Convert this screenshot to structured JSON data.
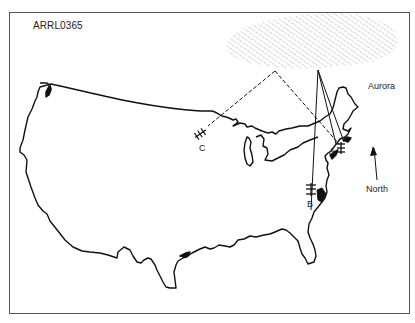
{
  "figure": {
    "id_label": "ARRL0365",
    "frame_color": "#555555",
    "line_color": "#111111",
    "hatch_color": "#9a9a9a"
  },
  "region": {
    "label": "Aurora",
    "icon": "hatched-aurora-region"
  },
  "compass": {
    "label": "North",
    "icon": "arrow-up-icon"
  },
  "stations": [
    {
      "id": "A",
      "label": "A",
      "icon": "antenna-icon"
    },
    {
      "id": "B",
      "label": "B",
      "icon": "antenna-icon"
    },
    {
      "id": "C",
      "label": "C",
      "icon": "antenna-icon"
    }
  ],
  "paths": [
    {
      "from": "A",
      "to": "B",
      "via": "Aurora",
      "style": "solid"
    },
    {
      "from": "A",
      "to": "C",
      "via": "Aurora",
      "style": "dashed"
    }
  ],
  "basemap": {
    "name": "Continental United States outline"
  }
}
